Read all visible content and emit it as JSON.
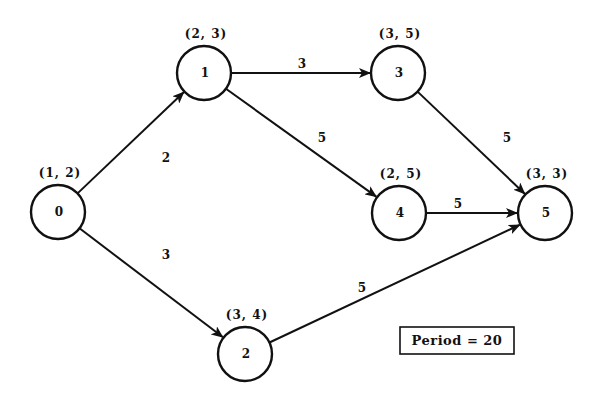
{
  "diagram": {
    "type": "directed-graph",
    "nodes": [
      {
        "id": "0",
        "label": "0",
        "pair": "(1, 2)",
        "x": 58,
        "y": 212
      },
      {
        "id": "1",
        "label": "1",
        "pair": "(2, 3)",
        "x": 204,
        "y": 73
      },
      {
        "id": "2",
        "label": "2",
        "pair": "(3, 4)",
        "x": 245,
        "y": 354
      },
      {
        "id": "3",
        "label": "3",
        "pair": "(3, 5)",
        "x": 398,
        "y": 73
      },
      {
        "id": "4",
        "label": "4",
        "pair": "(2, 5)",
        "x": 399,
        "y": 213
      },
      {
        "id": "5",
        "label": "5",
        "pair": "(3, 3)",
        "x": 545,
        "y": 213
      }
    ],
    "edges": [
      {
        "from": "0",
        "to": "1",
        "weight": "2",
        "lx": 166,
        "ly": 158
      },
      {
        "from": "0",
        "to": "2",
        "weight": "3",
        "lx": 166,
        "ly": 255
      },
      {
        "from": "1",
        "to": "3",
        "weight": "3",
        "lx": 302,
        "ly": 64
      },
      {
        "from": "1",
        "to": "4",
        "weight": "5",
        "lx": 322,
        "ly": 138
      },
      {
        "from": "3",
        "to": "5",
        "weight": "5",
        "lx": 507,
        "ly": 138
      },
      {
        "from": "4",
        "to": "5",
        "weight": "5",
        "lx": 458,
        "ly": 204
      },
      {
        "from": "2",
        "to": "5",
        "weight": "5",
        "lx": 362,
        "ly": 288
      }
    ],
    "period": {
      "label": "Period = 20",
      "x": 400,
      "y": 327,
      "w": 114,
      "h": 27
    }
  }
}
